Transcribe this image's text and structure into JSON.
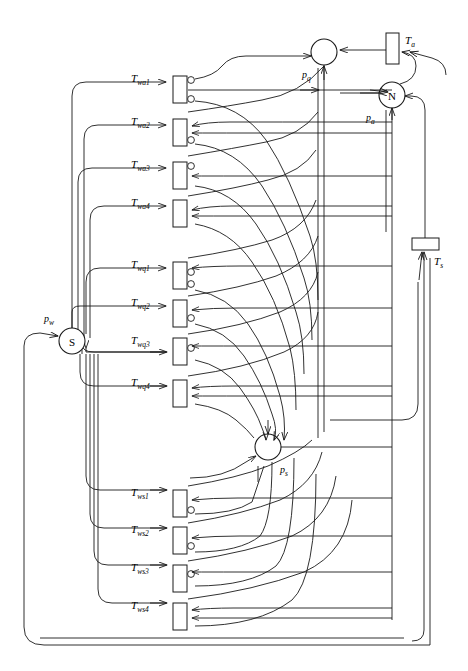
{
  "figure": {
    "type": "petri-net",
    "title": "",
    "caption": "",
    "width": 468,
    "height": 671,
    "line_color": "#1a1a1a",
    "background": "#ffffff"
  },
  "places": [
    {
      "id": "pq",
      "label": "p",
      "sub": "q",
      "marking": "",
      "cx": 324,
      "cy": 52,
      "r": 13,
      "label_x": 302,
      "label_y": 78
    },
    {
      "id": "pa",
      "label": "p",
      "sub": "a",
      "marking": "N",
      "cx": 392,
      "cy": 95,
      "r": 13,
      "label_x": 368,
      "label_y": 120
    },
    {
      "id": "pw",
      "label": "p",
      "sub": "w",
      "marking": "S",
      "cx": 72,
      "cy": 341,
      "r": 13,
      "label_x": 46,
      "label_y": 322
    },
    {
      "id": "ps",
      "label": "p",
      "sub": "s",
      "marking": "",
      "cx": 268,
      "cy": 447,
      "r": 13,
      "label_x": 281,
      "label_y": 472
    }
  ],
  "transitions": [
    {
      "id": "Twa1",
      "label": "T",
      "sub": "wa1",
      "x": 173,
      "y": 76,
      "w": 14,
      "h": 27,
      "label_x": 133,
      "label_y": 82
    },
    {
      "id": "Twa2",
      "label": "T",
      "sub": "wa2",
      "x": 173,
      "y": 119,
      "w": 14,
      "h": 27,
      "label_x": 133,
      "label_y": 125
    },
    {
      "id": "Twa3",
      "label": "T",
      "sub": "wa3",
      "x": 173,
      "y": 162,
      "w": 14,
      "h": 27,
      "label_x": 133,
      "label_y": 168
    },
    {
      "id": "Twa4",
      "label": "T",
      "sub": "wa4",
      "x": 173,
      "y": 200,
      "w": 14,
      "h": 27,
      "label_x": 133,
      "label_y": 206
    },
    {
      "id": "Twq1",
      "label": "T",
      "sub": "wq1",
      "x": 173,
      "y": 262,
      "w": 14,
      "h": 27,
      "label_x": 133,
      "label_y": 268
    },
    {
      "id": "Twq2",
      "label": "T",
      "sub": "wq2",
      "x": 173,
      "y": 300,
      "w": 14,
      "h": 27,
      "label_x": 133,
      "label_y": 306
    },
    {
      "id": "Twq3",
      "label": "T",
      "sub": "wq3",
      "x": 173,
      "y": 338,
      "w": 14,
      "h": 27,
      "label_x": 133,
      "label_y": 344
    },
    {
      "id": "Twq4",
      "label": "T",
      "sub": "wq4",
      "x": 173,
      "y": 380,
      "w": 14,
      "h": 27,
      "label_x": 133,
      "label_y": 386
    },
    {
      "id": "Tws1",
      "label": "T",
      "sub": "ws1",
      "x": 173,
      "y": 490,
      "w": 14,
      "h": 27,
      "label_x": 133,
      "label_y": 496
    },
    {
      "id": "Tws2",
      "label": "T",
      "sub": "ws2",
      "x": 173,
      "y": 527,
      "w": 14,
      "h": 27,
      "label_x": 133,
      "label_y": 533
    },
    {
      "id": "Tws3",
      "label": "T",
      "sub": "ws3",
      "x": 173,
      "y": 565,
      "w": 14,
      "h": 27,
      "label_x": 133,
      "label_y": 571
    },
    {
      "id": "Tws4",
      "label": "T",
      "sub": "ws4",
      "x": 173,
      "y": 603,
      "w": 14,
      "h": 27,
      "label_x": 133,
      "label_y": 609
    },
    {
      "id": "Ta",
      "label": "T",
      "sub": "a",
      "x": 386,
      "y": 33,
      "w": 13,
      "h": 31,
      "label_x": 405,
      "label_y": 44
    },
    {
      "id": "Ts",
      "label": "T",
      "sub": "s",
      "x": 412,
      "y": 238,
      "w": 27,
      "h": 12,
      "label_x": 434,
      "label_y": 265
    }
  ],
  "groups": [
    {
      "name": "wa",
      "label_prefix": "T",
      "members": [
        "Twa1",
        "Twa2",
        "Twa3",
        "Twa4"
      ]
    },
    {
      "name": "wq",
      "label_prefix": "T",
      "members": [
        "Twq1",
        "Twq2",
        "Twq3",
        "Twq4"
      ]
    },
    {
      "name": "ws",
      "label_prefix": "T",
      "members": [
        "Tws1",
        "Tws2",
        "Tws3",
        "Tws4"
      ]
    }
  ],
  "legend": {
    "place_marking_pa": "N",
    "place_marking_pw": "S"
  }
}
